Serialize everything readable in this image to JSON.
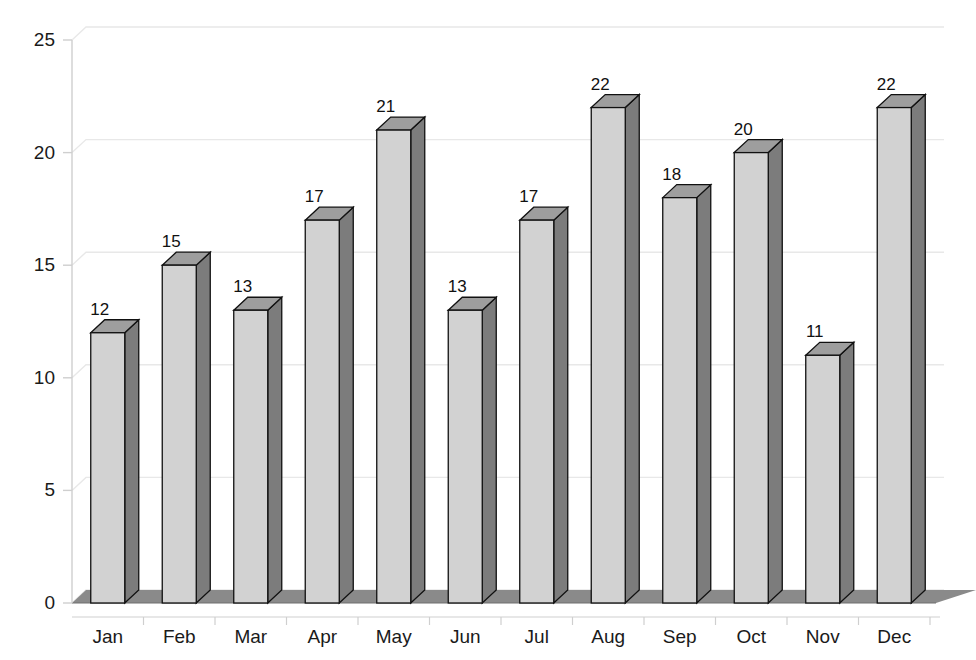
{
  "chart_data": {
    "type": "bar",
    "title": "",
    "subtitle": "",
    "xlabel": "",
    "ylabel": "",
    "categories": [
      "Jan",
      "Feb",
      "Mar",
      "Apr",
      "May",
      "Jun",
      "Jul",
      "Aug",
      "Sep",
      "Oct",
      "Nov",
      "Dec"
    ],
    "values": [
      12,
      15,
      13,
      17,
      21,
      13,
      17,
      22,
      18,
      20,
      11,
      22
    ],
    "data_labels": [
      "12",
      "15",
      "13",
      "17",
      "21",
      "13",
      "17",
      "22",
      "18",
      "20",
      "11",
      "22"
    ],
    "ylim": [
      0,
      25
    ],
    "ytick_values": [
      0,
      5,
      10,
      15,
      20,
      25
    ],
    "ytick_labels": [
      "0",
      "5",
      "10",
      "15",
      "20",
      "25"
    ],
    "grid": true,
    "grid_axis": "y",
    "legend": null,
    "legend_position": "none",
    "style": "3d-column",
    "annotations": []
  },
  "colors": {
    "bar_front": "#d2d2d2",
    "bar_side": "#7c7c7c",
    "bar_top": "#9e9e9e",
    "bar_outline": "#111111",
    "floor": "#8a8a8a",
    "floor_edge": "#6f6f6f",
    "grid_line": "#e8e8e8",
    "axis_line": "#cfcfcf",
    "text": "#1a1a1a",
    "background": "#ffffff"
  },
  "geometry": {
    "plot_left": 72,
    "plot_right": 930,
    "plot_top": 40,
    "plot_bottom": 603,
    "depth_x": 14,
    "depth_y": -13,
    "bar_width": 34,
    "band_width": 71
  }
}
